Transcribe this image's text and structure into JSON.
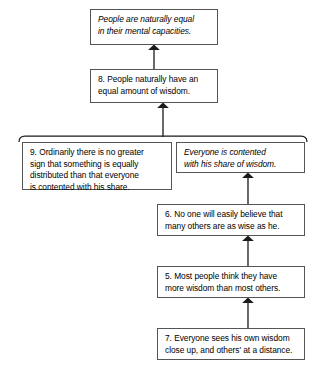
{
  "diagram": {
    "type": "argument-map",
    "title": "",
    "nodes": [
      {
        "id": "conclusion",
        "label": "People are naturally equal\nin their mental capacities.",
        "style": "italic",
        "role": "main-conclusion"
      },
      {
        "id": "8",
        "label": "8. People naturally have an\nequal amount of wisdom.",
        "style": "roman",
        "role": "intermediate-conclusion"
      },
      {
        "id": "9",
        "label": "9. Ordinarily there is no greater\nsign that something is equally\ndistributed than that everyone\nis contented with his share.",
        "style": "roman",
        "role": "linked-premise"
      },
      {
        "id": "contented",
        "label": "Everyone is contented\nwith his share of wisdom.",
        "style": "italic",
        "role": "linked-premise"
      },
      {
        "id": "6",
        "label": "6. No one will easily believe that\nmany others are as wise as he.",
        "style": "roman",
        "role": "premise"
      },
      {
        "id": "5",
        "label": "5. Most people think they have\nmore wisdom than most others.",
        "style": "roman",
        "role": "premise"
      },
      {
        "id": "7",
        "label": "7. Everyone sees his own wisdom\nclose up, and others' at a distance.",
        "style": "roman",
        "role": "premise"
      }
    ],
    "edges": [
      {
        "from": "8",
        "to": "conclusion",
        "kind": "arrow"
      },
      {
        "from": "linked-bracket-9-contented",
        "to": "8",
        "kind": "arrow"
      },
      {
        "from": "6",
        "to": "contented",
        "kind": "arrow"
      },
      {
        "from": "5",
        "to": "6",
        "kind": "arrow"
      },
      {
        "from": "7",
        "to": "5",
        "kind": "arrow"
      }
    ],
    "bracket": {
      "name": "linked-premise-bracket",
      "spans": [
        "9",
        "contented"
      ]
    },
    "colors": {
      "background": "#ffffff",
      "box_border": "#555555",
      "text": "#000000",
      "connector": "#1a1a1a"
    }
  }
}
